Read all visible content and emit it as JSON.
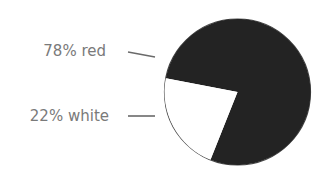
{
  "chart_data": {
    "type": "pie",
    "title": "",
    "slices": [
      {
        "label": "red",
        "value": 78,
        "display": "78% red",
        "color": "#232323"
      },
      {
        "label": "white",
        "value": 22,
        "display": "22% white",
        "color": "#ffffff"
      }
    ],
    "legend_position": "left",
    "outline_color": "#4a4a4a"
  },
  "labels": {
    "red": "78% red",
    "white": "22% white"
  }
}
